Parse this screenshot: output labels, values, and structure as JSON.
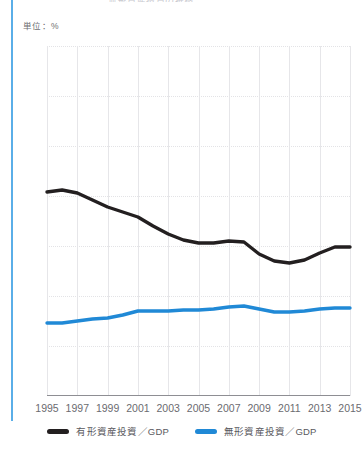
{
  "title_clipped": "無形資産投資の推移",
  "unit_label": "単位：%",
  "colors": {
    "tangible": "#231f20",
    "intangible": "#2089d6",
    "grid": "#e6e6e9",
    "axis": "#8e8e93",
    "text": "#6b6b70",
    "rule": "#5aaee8"
  },
  "legend": {
    "items": [
      {
        "label": "有形資産投資／GDP",
        "color": "#231f20",
        "swatch": "legend-swatch-tangible"
      },
      {
        "label": "無形資産投資／GDP",
        "color": "#2089d6",
        "swatch": "legend-swatch-intangible"
      }
    ]
  },
  "chart_data": {
    "type": "line",
    "title": "無形資産投資の推移",
    "xlabel": "",
    "ylabel": "単位：%",
    "ylim": [
      0,
      35
    ],
    "xlim": [
      1995,
      2015
    ],
    "grid": true,
    "legend_position": "bottom",
    "yticks": [
      0,
      5,
      10,
      15,
      20,
      25,
      30,
      35
    ],
    "xticks": [
      1995,
      1997,
      1999,
      2001,
      2003,
      2005,
      2007,
      2009,
      2011,
      2013,
      2015
    ],
    "x": [
      1995,
      1996,
      1997,
      1998,
      1999,
      2000,
      2001,
      2002,
      2003,
      2004,
      2005,
      2006,
      2007,
      2008,
      2009,
      2010,
      2011,
      2012,
      2013,
      2014,
      2015
    ],
    "series": [
      {
        "name": "有形資産投資／GDP",
        "color": "#231f20",
        "values": [
          20.4,
          20.6,
          20.3,
          19.6,
          18.9,
          18.4,
          17.9,
          17.0,
          16.2,
          15.6,
          15.3,
          15.3,
          15.5,
          15.4,
          14.2,
          13.5,
          13.3,
          13.6,
          14.3,
          14.9,
          14.9
        ]
      },
      {
        "name": "無形資産投資／GDP",
        "color": "#2089d6",
        "values": [
          7.3,
          7.3,
          7.5,
          7.7,
          7.8,
          8.1,
          8.5,
          8.5,
          8.5,
          8.6,
          8.6,
          8.7,
          8.9,
          9.0,
          8.7,
          8.4,
          8.4,
          8.5,
          8.7,
          8.8,
          8.8
        ]
      }
    ]
  }
}
